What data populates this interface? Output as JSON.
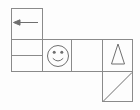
{
  "figure": {
    "kind": "grid-figure-puzzle",
    "width": 140,
    "height": 110,
    "background_color": "#fdfdfd",
    "stroke_color": "#8a8a8a",
    "stroke_width": 1,
    "glyph_color": "#6f6f6f"
  },
  "grid": {
    "description": "Row of square cells with an extra stacked cell above-left and one below-right",
    "left_edge": 11,
    "right_edge": 133,
    "main_row_top": 40,
    "main_row_bottom": 72,
    "column_x": [
      11,
      43,
      72,
      103,
      133
    ],
    "left_stack_rows_y": [
      8,
      40,
      56,
      72
    ],
    "bottom_cell": {
      "x": 103,
      "y": 72,
      "w": 30,
      "h": 30
    }
  },
  "cells": [
    {
      "id": "cell-top-left",
      "label": "arrow cell",
      "x": 11,
      "y": 8,
      "w": 32,
      "h": 32,
      "content": "left-arrow-icon"
    },
    {
      "id": "cell-mid-left-upper",
      "label": "empty cell upper",
      "x": 11,
      "y": 40,
      "w": 32,
      "h": 16,
      "content": "empty"
    },
    {
      "id": "cell-mid-left-lower",
      "label": "empty cell lower",
      "x": 11,
      "y": 56,
      "w": 32,
      "h": 16,
      "content": "empty"
    },
    {
      "id": "cell-smiley",
      "label": "smiley face cell",
      "x": 43,
      "y": 40,
      "w": 29,
      "h": 32,
      "content": "smiley-face-icon"
    },
    {
      "id": "cell-blank",
      "label": "blank cell",
      "x": 72,
      "y": 40,
      "w": 31,
      "h": 32,
      "content": "empty"
    },
    {
      "id": "cell-triangle",
      "label": "triangle cell",
      "x": 103,
      "y": 40,
      "w": 30,
      "h": 32,
      "content": "triangle-icon"
    },
    {
      "id": "cell-diagonal",
      "label": "diagonal line cell",
      "x": 103,
      "y": 72,
      "w": 30,
      "h": 30,
      "content": "diagonal-line-icon"
    }
  ],
  "glyphs": {
    "left_arrow": {
      "name": "left-arrow-icon",
      "line_from_x": 38,
      "line_to_x": 15,
      "line_y": 22,
      "head_points": "14,22 20,19.5 20,24.5"
    },
    "smiley": {
      "name": "smiley-face-icon",
      "center_x": 58,
      "center_y": 56,
      "radius": 11,
      "eye_left_x": 54,
      "eye_right_x": 62,
      "eye_y": 52,
      "eye_radius": 1.6,
      "mouth_path": "M 52.5 58.5 Q 58 63.5 63.5 58.5"
    },
    "triangle": {
      "name": "triangle-icon",
      "points": "118,44 124.5,64 111.5,64"
    },
    "diagonal": {
      "name": "diagonal-line-icon",
      "from_x": 104,
      "from_y": 101,
      "to_x": 132,
      "to_y": 73
    }
  }
}
